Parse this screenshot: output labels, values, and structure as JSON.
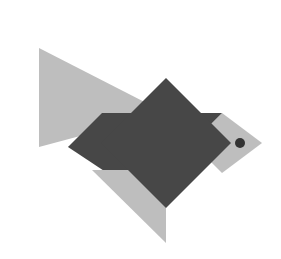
{
  "artwork": {
    "title": "Tangram Fish",
    "description": "A geometric tangram-style fish puzzle figure made of flat triangles and squares in two shades of gray on a white background.",
    "canvas": {
      "width": 281,
      "height": 259,
      "background_color": "#ffffff"
    },
    "palette": {
      "light_gray": "#bebebe",
      "dark_gray": "#474747",
      "eye_color": "#333333",
      "background": "#ffffff"
    },
    "pieces": [
      {
        "id": "tail-upper",
        "label": "Tail upper triangle",
        "shape": "triangle",
        "color": "#bebebe",
        "points": "39,48 39,147 166,113"
      },
      {
        "id": "body-band",
        "label": "Body band triangle",
        "shape": "triangle",
        "color": "#474747",
        "points": "68,147 102,113 222,113 188,147"
      },
      {
        "id": "tail-lower",
        "label": "Tail lower triangle",
        "shape": "triangle",
        "color": "#474747",
        "points": "68,147 166,113 166,212"
      },
      {
        "id": "body-diamond",
        "label": "Body diamond square",
        "shape": "square-rotated",
        "color": "#474747",
        "points": "166,78 231,143 166,208 101,143"
      },
      {
        "id": "fin-lower",
        "label": "Lower fin triangle",
        "shape": "triangle",
        "color": "#bebebe",
        "points": "92,170 166,170 166,243"
      },
      {
        "id": "head",
        "label": "Head square",
        "shape": "square-rotated",
        "color": "#bebebe",
        "points": "222,113 262,143 222,173 192,143"
      },
      {
        "id": "eye",
        "label": "Eye dot",
        "shape": "circle",
        "color": "#333333",
        "cx": 240,
        "cy": 143,
        "r": 5
      }
    ]
  }
}
